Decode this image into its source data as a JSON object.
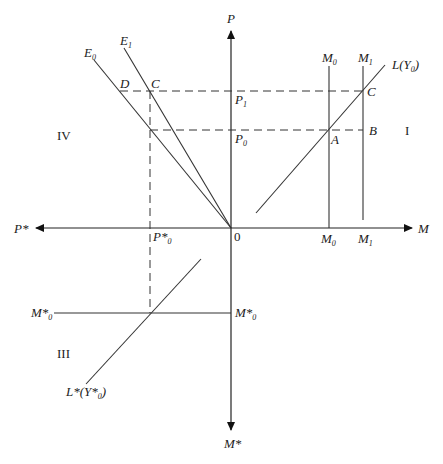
{
  "diagram": {
    "type": "four-quadrant money market diagram",
    "axes": {
      "up": {
        "label": "P"
      },
      "right": {
        "label": "M"
      },
      "left": {
        "label": "P*"
      },
      "down": {
        "label": "M*"
      },
      "origin": {
        "label": "0"
      }
    },
    "quadrants": {
      "I": "I",
      "III": "III",
      "IV": "IV"
    },
    "curves": {
      "E0": {
        "main": "E",
        "sub": "0"
      },
      "E1": {
        "main": "E",
        "sub": "1"
      },
      "L": {
        "main": "L(Y",
        "sub": "0",
        "tail": ")"
      },
      "Lstar": {
        "main": "L*(Y*",
        "sub": "0",
        "tail": ")"
      },
      "M0_top": {
        "main": "M",
        "sub": "0"
      },
      "M1_top": {
        "main": "M",
        "sub": "1"
      }
    },
    "axis_ticks": {
      "P1": {
        "main": "P",
        "sub": "1"
      },
      "P0": {
        "main": "P",
        "sub": "0"
      },
      "M0": {
        "main": "M",
        "sub": "0"
      },
      "M1": {
        "main": "M",
        "sub": "1"
      },
      "Pstar0": {
        "main": "P*",
        "sub": "0"
      },
      "Mstar0_left": {
        "main": "M*",
        "sub": "0"
      },
      "Mstar0_right": {
        "main": "M*",
        "sub": "0"
      }
    },
    "points": {
      "A": "A",
      "B": "B",
      "C_right": "C",
      "C_left": "C",
      "D": "D"
    }
  }
}
